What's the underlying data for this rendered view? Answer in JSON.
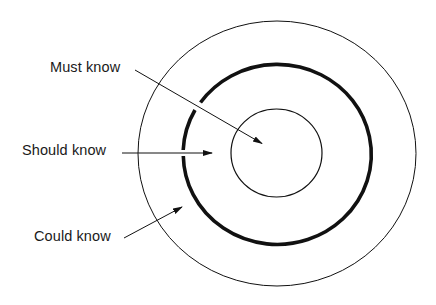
{
  "diagram": {
    "type": "concentric-circles",
    "background_color": "#ffffff",
    "stroke_color": "#111111",
    "rings": [
      {
        "name": "inner",
        "meaning": "Must know",
        "stroke_width": 1.2
      },
      {
        "name": "middle",
        "meaning": "Should know",
        "stroke_width": 3.5
      },
      {
        "name": "outer",
        "meaning": "Could know",
        "stroke_width": 1
      }
    ],
    "labels": {
      "must_know": "Must know",
      "should_know": "Should know",
      "could_know": "Could know"
    }
  }
}
